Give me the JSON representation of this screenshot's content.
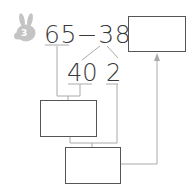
{
  "problem": {
    "badge_number": "3",
    "equation": "65−38=",
    "minuend": "65",
    "operator": "−",
    "subtrahend": "38",
    "equals": "=",
    "split_left": "40",
    "split_right": "2"
  },
  "boxes": {
    "answer_box": "",
    "step1_box": "",
    "step2_box": ""
  },
  "colors": {
    "text": "#3a3a3a",
    "lines": "#aaaaaa",
    "box_border": "#555555",
    "badge": "#c4c4c4"
  }
}
